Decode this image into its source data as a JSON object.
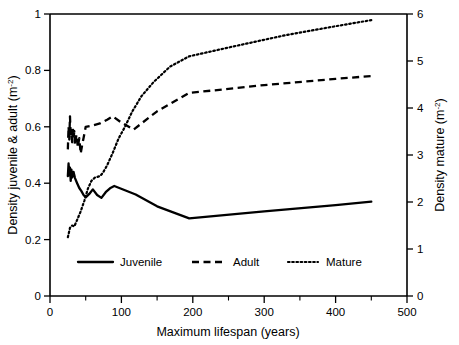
{
  "chart_data": {
    "type": "line",
    "title": "",
    "xlabel": "Maximum lifespan (years)",
    "ylabel": "Density juvenile & adult (m-2)",
    "ylabel_right": "Density mature (m-2)",
    "xlim": [
      0,
      500
    ],
    "ylim": [
      0,
      1
    ],
    "ylim_right": [
      0,
      6
    ],
    "grid": false,
    "legend_position": "inside-bottom-center",
    "xticks": [
      0,
      100,
      200,
      300,
      400,
      500
    ],
    "xticklabels": [
      "0",
      "100",
      "200",
      "300",
      "400",
      "500"
    ],
    "xticks_minor": [
      50,
      150,
      250,
      350,
      450
    ],
    "yticks": [
      0,
      0.2,
      0.4,
      0.6,
      0.8,
      1
    ],
    "yticklabels": [
      "0",
      "0.2",
      "0.4",
      "0.6",
      "0.8",
      "1"
    ],
    "yticks_right": [
      0,
      1,
      2,
      3,
      4,
      5,
      6
    ],
    "yticklabels_right": [
      "0",
      "1",
      "2",
      "3",
      "4",
      "5",
      "6"
    ],
    "series": [
      {
        "name": "Juvenile",
        "style": "solid",
        "axis": "left",
        "points": [
          [
            25,
            0.425
          ],
          [
            26,
            0.47
          ],
          [
            27,
            0.428
          ],
          [
            28,
            0.455
          ],
          [
            29,
            0.408
          ],
          [
            30,
            0.448
          ],
          [
            31,
            0.42
          ],
          [
            33,
            0.44
          ],
          [
            35,
            0.418
          ],
          [
            38,
            0.4
          ],
          [
            41,
            0.383
          ],
          [
            44,
            0.372
          ],
          [
            47,
            0.358
          ],
          [
            50,
            0.35
          ],
          [
            55,
            0.362
          ],
          [
            60,
            0.378
          ],
          [
            66,
            0.358
          ],
          [
            72,
            0.348
          ],
          [
            78,
            0.368
          ],
          [
            84,
            0.382
          ],
          [
            90,
            0.39
          ],
          [
            120,
            0.36
          ],
          [
            150,
            0.318
          ],
          [
            195,
            0.275
          ],
          [
            300,
            0.3
          ],
          [
            400,
            0.322
          ],
          [
            450,
            0.335
          ]
        ]
      },
      {
        "name": "Adult",
        "style": "dashed",
        "axis": "left",
        "points": [
          [
            25,
            0.52
          ],
          [
            26,
            0.6
          ],
          [
            27,
            0.555
          ],
          [
            28,
            0.637
          ],
          [
            29,
            0.565
          ],
          [
            30,
            0.59
          ],
          [
            31,
            0.545
          ],
          [
            32,
            0.598
          ],
          [
            33,
            0.558
          ],
          [
            34,
            0.585
          ],
          [
            35,
            0.535
          ],
          [
            37,
            0.572
          ],
          [
            39,
            0.528
          ],
          [
            41,
            0.56
          ],
          [
            43,
            0.505
          ],
          [
            45,
            0.535
          ],
          [
            47,
            0.56
          ],
          [
            50,
            0.6
          ],
          [
            60,
            0.605
          ],
          [
            70,
            0.612
          ],
          [
            80,
            0.625
          ],
          [
            88,
            0.637
          ],
          [
            100,
            0.615
          ],
          [
            117,
            0.59
          ],
          [
            150,
            0.655
          ],
          [
            195,
            0.72
          ],
          [
            300,
            0.748
          ],
          [
            400,
            0.77
          ],
          [
            450,
            0.78
          ]
        ]
      },
      {
        "name": "Mature",
        "style": "dotted",
        "axis": "right",
        "points": [
          [
            25,
            1.25
          ],
          [
            28,
            1.45
          ],
          [
            31,
            1.5
          ],
          [
            34,
            1.48
          ],
          [
            38,
            1.62
          ],
          [
            43,
            1.8
          ],
          [
            48,
            2.02
          ],
          [
            53,
            2.28
          ],
          [
            58,
            2.45
          ],
          [
            63,
            2.52
          ],
          [
            70,
            2.55
          ],
          [
            74,
            2.62
          ],
          [
            80,
            2.78
          ],
          [
            88,
            3.05
          ],
          [
            96,
            3.35
          ],
          [
            105,
            3.6
          ],
          [
            115,
            3.92
          ],
          [
            128,
            4.25
          ],
          [
            145,
            4.55
          ],
          [
            168,
            4.88
          ],
          [
            195,
            5.1
          ],
          [
            260,
            5.32
          ],
          [
            330,
            5.55
          ],
          [
            400,
            5.74
          ],
          [
            450,
            5.87
          ]
        ],
        "points_left_equivalent": [
          [
            25,
            0.208
          ],
          [
            28,
            0.242
          ],
          [
            31,
            0.25
          ],
          [
            34,
            0.247
          ],
          [
            38,
            0.27
          ],
          [
            43,
            0.3
          ],
          [
            48,
            0.337
          ],
          [
            53,
            0.38
          ],
          [
            58,
            0.408
          ],
          [
            63,
            0.42
          ],
          [
            70,
            0.425
          ],
          [
            74,
            0.437
          ],
          [
            80,
            0.463
          ],
          [
            88,
            0.508
          ],
          [
            96,
            0.558
          ],
          [
            105,
            0.6
          ],
          [
            115,
            0.653
          ],
          [
            128,
            0.708
          ],
          [
            145,
            0.758
          ],
          [
            168,
            0.813
          ],
          [
            195,
            0.85
          ],
          [
            260,
            0.887
          ],
          [
            330,
            0.925
          ],
          [
            400,
            0.957
          ],
          [
            450,
            0.978
          ]
        ]
      }
    ],
    "legend": [
      {
        "label": "Juvenile",
        "style": "solid"
      },
      {
        "label": "Adult",
        "style": "dashed"
      },
      {
        "label": "Mature",
        "style": "dotted"
      }
    ]
  }
}
